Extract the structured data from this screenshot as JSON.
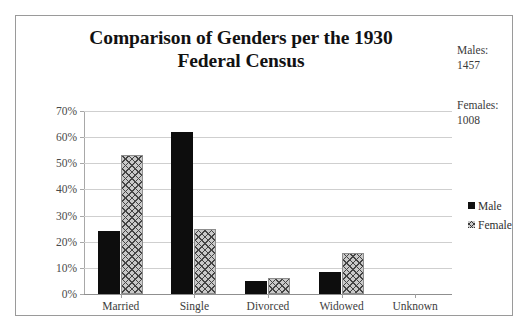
{
  "chart_data": {
    "type": "bar",
    "title": "Comparison of Genders per the 1930 Federal Census",
    "title_line1": "Comparison of Genders per the 1930",
    "title_line2": "Federal Census",
    "categories": [
      "Married",
      "Single",
      "Divorced",
      "Widowed",
      "Unknown"
    ],
    "series": [
      {
        "name": "Male",
        "values": [
          24,
          62,
          5,
          8.5,
          0
        ],
        "color": "#0d0d0d",
        "pattern": "solid"
      },
      {
        "name": "Female",
        "values": [
          53,
          25,
          6,
          15.5,
          0
        ],
        "color": "#c9c9c9",
        "pattern": "cross-hatch"
      }
    ],
    "xlabel": "",
    "ylabel": "",
    "ylim": [
      0,
      70
    ],
    "ytick_step": 10,
    "ytick_labels": [
      "0%",
      "10%",
      "20%",
      "30%",
      "40%",
      "50%",
      "60%",
      "70%"
    ],
    "ytick_values": [
      0,
      10,
      20,
      30,
      40,
      50,
      60,
      70
    ],
    "grid": true,
    "grid_axis": "y",
    "legend_position": "right",
    "legend_entries": [
      "Male",
      "Female"
    ]
  },
  "annotations": {
    "males": "Males:\n1457",
    "females": "Females:\n1008",
    "males_label": "Males:",
    "males_count": "1457",
    "females_label": "Females:",
    "females_count": "1008"
  }
}
